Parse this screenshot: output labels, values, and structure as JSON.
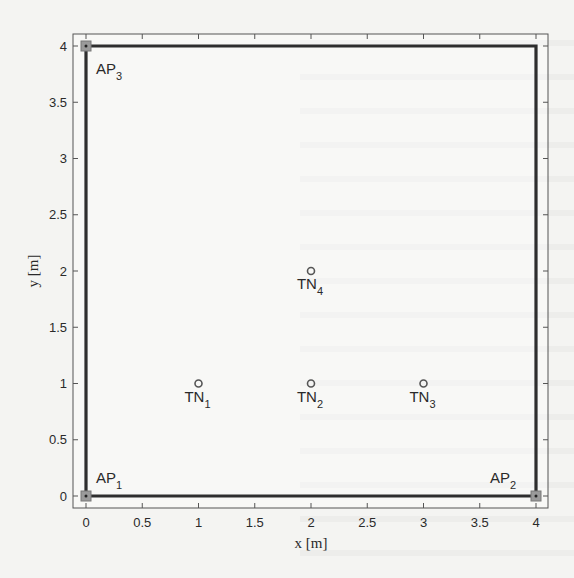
{
  "chart_data": {
    "type": "scatter",
    "title": "",
    "xlabel": "x [m]",
    "ylabel": "y [m]",
    "xlim": [
      0,
      4
    ],
    "ylim": [
      0,
      4
    ],
    "grid": false,
    "legend": "none",
    "xticks": [
      0,
      0.5,
      1,
      1.5,
      2,
      2.5,
      3,
      3.5,
      4
    ],
    "yticks": [
      0,
      0.5,
      1,
      1.5,
      2,
      2.5,
      3,
      3.5,
      4
    ],
    "xtick_labels": [
      "0",
      "0.5",
      "1",
      "1.5",
      "2",
      "2.5",
      "3",
      "3.5",
      "4"
    ],
    "ytick_labels": [
      "0",
      "0.5",
      "1",
      "1.5",
      "2",
      "2.5",
      "3",
      "3.5",
      "4"
    ],
    "boundary": {
      "name": "room boundary",
      "x": [
        0,
        4,
        4,
        0,
        0
      ],
      "y": [
        0,
        0,
        4,
        4,
        0
      ]
    },
    "series": [
      {
        "name": "Access Points",
        "marker": "square",
        "points": [
          {
            "x": 0,
            "y": 0,
            "label": "AP",
            "sub": "1",
            "label_pos": "upper-right"
          },
          {
            "x": 4,
            "y": 0,
            "label": "AP",
            "sub": "2",
            "label_pos": "upper-left"
          },
          {
            "x": 0,
            "y": 4,
            "label": "AP",
            "sub": "3",
            "label_pos": "lower-right"
          }
        ]
      },
      {
        "name": "Target Nodes",
        "marker": "circle",
        "points": [
          {
            "x": 1,
            "y": 1,
            "label": "TN",
            "sub": "1",
            "label_pos": "below"
          },
          {
            "x": 2,
            "y": 1,
            "label": "TN",
            "sub": "2",
            "label_pos": "below"
          },
          {
            "x": 3,
            "y": 1,
            "label": "TN",
            "sub": "3",
            "label_pos": "below"
          },
          {
            "x": 2,
            "y": 2,
            "label": "TN",
            "sub": "4",
            "label_pos": "below"
          }
        ]
      }
    ]
  },
  "colors": {
    "boundary_line": "#2e2e2e",
    "axes_frame": "#555555",
    "ap_marker_fill": "#9a9a9a",
    "tn_marker_stroke": "#555555"
  }
}
